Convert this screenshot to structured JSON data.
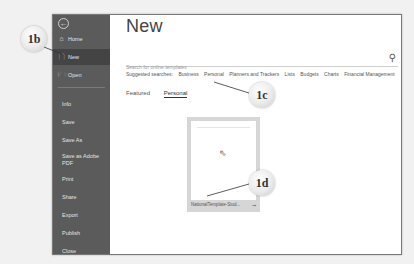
{
  "sidebar": {
    "back_icon": "←",
    "top_items": [
      {
        "label": "Home",
        "icon": "⌂"
      },
      {
        "label": "New",
        "icon": "🗋",
        "selected": true
      },
      {
        "label": "Open",
        "icon": "🗁"
      }
    ],
    "items": [
      "Info",
      "Save",
      "Save As",
      "Save as Adobe PDF",
      "Print",
      "Share",
      "Export",
      "Publish",
      "Close"
    ]
  },
  "main": {
    "title": "New",
    "search": {
      "placeholder": "Search for online templates",
      "value": ""
    },
    "suggested": {
      "label": "Suggested searches:",
      "items": [
        "Business",
        "Personal",
        "Planners and Trackers",
        "Lists",
        "Budgets",
        "Charts",
        "Financial Management"
      ]
    },
    "tabs": [
      {
        "label": "Featured",
        "active": false
      },
      {
        "label": "Personal",
        "active": true
      }
    ],
    "template": {
      "label": "NationalTemplate-Stud...",
      "pin_icon": "⊸"
    }
  },
  "callouts": {
    "c1b": "1b",
    "c1c": "1c",
    "c1d": "1d"
  }
}
